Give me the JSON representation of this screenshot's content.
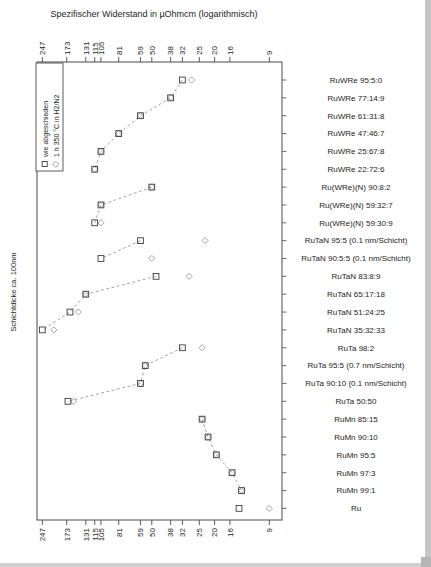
{
  "title": "Spezifischer Widerstand in µOhmcm (logarithmisch)",
  "left_axis_label": "Schichtdicke ca. 100nm",
  "legend": {
    "items": [
      {
        "marker": "square-marker-icon",
        "label": "wie abgeschieden"
      },
      {
        "marker": "diamond-marker-icon",
        "label": "1 h 350 °C in H2/N2"
      }
    ]
  },
  "chart_data": {
    "type": "scatter",
    "orientation": "horizontal",
    "x_scale": "log10-reversed",
    "title": "Spezifischer Widerstand in µOhmcm (logarithmisch)",
    "ylabel": "Schichtdicke ca. 100nm",
    "x_ticks": [
      247,
      173,
      131,
      115,
      105,
      81,
      59,
      50,
      38,
      32,
      25,
      20,
      16,
      9
    ],
    "x_range": [
      260,
      8
    ],
    "grid": false,
    "legend_position": "top-left-inside",
    "categories": [
      "RuWRe 95:5:0",
      "RuWRe 77:14:9",
      "RuWRe 61:31:8",
      "RuWRe 47:46:7",
      "RuWRe 25:67:8",
      "RuWRe 22:72:6",
      "Ru(WRe)(N) 90:8:2",
      "Ru(WRe)(N) 59:32:7",
      "Ru(WRe)(N) 59:30:9",
      "RuTaN 95:5 (0.1 nm/Schicht)",
      "RuTaN 90:5:5 (0.1 nm/Schicht)",
      "RuTaN 83:8:9",
      "RuTaN 65:17:18",
      "RuTaN 51:24:25",
      "RuTaN 35:32:33",
      "RuTa 98:2",
      "RuTa 95:5 (0.7 nm/Schicht)",
      "RuTa 90:10 (0.1 nm/Schicht)",
      "RuTa 50:50",
      "RuMn 85:15",
      "RuMn 90:10",
      "RuMn 95:5",
      "RuMn 97:3",
      "RuMn 99:1",
      "Ru"
    ],
    "series": [
      {
        "name": "wie abgeschieden",
        "marker": "square",
        "values": [
          32,
          38,
          59,
          81,
          105,
          115,
          50,
          105,
          115,
          59,
          105,
          47,
          131,
          165,
          247,
          32,
          55,
          59,
          170,
          24,
          22,
          19.5,
          15.5,
          13.5,
          14
        ]
      },
      {
        "name": "1 h 350 °C in H2/N2",
        "marker": "diamond",
        "values": [
          28,
          38,
          59,
          81,
          105,
          115,
          50,
          105,
          105,
          23,
          50,
          29,
          131,
          146,
          209,
          24,
          55,
          59,
          157,
          24,
          22,
          19.5,
          15.5,
          13.5,
          9
        ]
      }
    ],
    "dashed_line_groups": [
      [
        0,
        5
      ],
      [
        6,
        8
      ],
      [
        9,
        10
      ],
      [
        11,
        14
      ],
      [
        15,
        18
      ],
      [
        19,
        23
      ]
    ]
  }
}
